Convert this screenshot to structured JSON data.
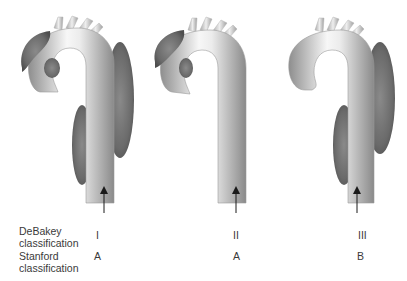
{
  "figure": {
    "panels": [
      {
        "id": "panel-1",
        "debakey": "I",
        "stanford": "A",
        "dissection_extent": "ascending aorta, arch and descending aorta"
      },
      {
        "id": "panel-2",
        "debakey": "II",
        "stanford": "A",
        "dissection_extent": "ascending aorta only"
      },
      {
        "id": "panel-3",
        "debakey": "III",
        "stanford": "B",
        "dissection_extent": "descending aorta only"
      }
    ],
    "row_labels": {
      "debakey": [
        "DeBakey",
        "classification"
      ],
      "stanford": [
        "Stanford",
        "classification"
      ]
    },
    "colors": {
      "vessel_light": "#f4f4f4",
      "vessel_dark": "#8c8c8c",
      "false_lumen": "#6e6e6e",
      "arrow": "#1a1a1a",
      "text": "#3a3a3a"
    }
  }
}
